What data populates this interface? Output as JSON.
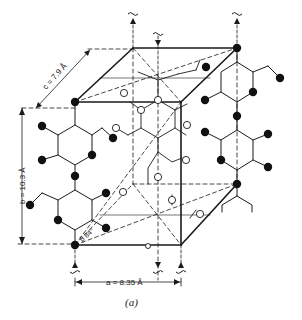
{
  "figure": {
    "caption": "(a)",
    "labels": {
      "a": "a = 8.35 Å",
      "b": "b = 10.3 Å",
      "c": "c = 7.9 Å",
      "beta": "β  84°"
    },
    "symbols": {
      "screw_axis_up": "↑",
      "screw_axis_down": "↓"
    },
    "legend": {
      "filled_atom": "chain atom (corner chains)",
      "open_atom": "chain atom (center chain)"
    },
    "colors": {
      "ink": "#1a1a1a",
      "background": "#ffffff"
    }
  }
}
